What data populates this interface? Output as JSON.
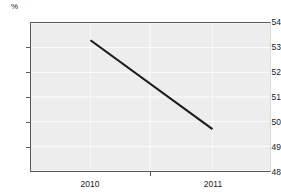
{
  "chart_data": {
    "type": "line",
    "title": "",
    "subtitle": "",
    "xlabel": "",
    "ylabel": "",
    "unit_label": "%",
    "categories": [
      "2010",
      "2011"
    ],
    "x": [
      2010.0,
      2011.0
    ],
    "series": [
      {
        "name": "",
        "values": [
          53.3,
          49.7
        ],
        "color": "#1a1a1a"
      }
    ],
    "xlim": [
      2009.5,
      2011.46
    ],
    "ylim": [
      48,
      54
    ],
    "ytick_labels": [
      "54",
      "53",
      "52",
      "51",
      "50",
      "49",
      "48"
    ],
    "ytick_values": [
      54,
      53,
      52,
      51,
      50,
      49,
      48
    ],
    "xtick_labels": [
      "2010",
      "2011"
    ],
    "xtick_positions": [
      90,
      213
    ],
    "xtick_mark_positions": [
      150
    ],
    "grid": true,
    "grid_color": "#ffffff",
    "plot_background": "#ededed",
    "axis_color": "#5a5a5a",
    "legend": "none",
    "legend_entries": []
  }
}
